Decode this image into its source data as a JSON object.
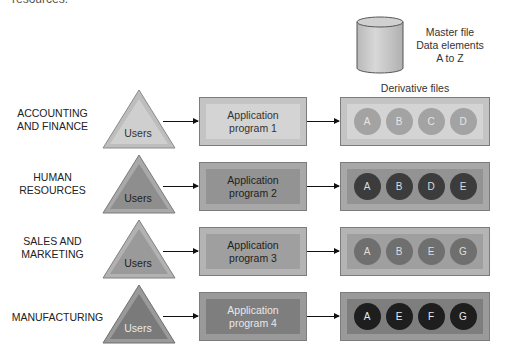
{
  "caption": "resources.",
  "master_file": {
    "lines": [
      "Master file",
      "Data elements",
      "A to Z"
    ]
  },
  "derivative_files_title": "Derivative files",
  "users_label": "Users",
  "colors": {
    "row1": {
      "tri_outer": "#bdbdbd",
      "tri_inner": "#cfcfcf",
      "box": "#c4c4c4",
      "box_inner": "#d4d4d4",
      "circle": "#a3a3a3",
      "text": "#333333",
      "circle_text": "#e6e6e6"
    },
    "row2": {
      "tri_outer": "#a9a9a9",
      "tri_inner": "#8e8e8e",
      "box": "#a8a8a8",
      "box_inner": "#939393",
      "circle": "#3c3c3c",
      "text": "#222222",
      "circle_text": "#dddddd"
    },
    "row3": {
      "tri_outer": "#b2b2b2",
      "tri_inner": "#9a9a9a",
      "box": "#b4b4b4",
      "box_inner": "#9f9f9f",
      "circle": "#6f6f6f",
      "text": "#222222",
      "circle_text": "#dddddd"
    },
    "row4": {
      "tri_outer": "#9a9a9a",
      "tri_inner": "#7a7a7a",
      "box": "#9a9a9a",
      "box_inner": "#7e7e7e",
      "circle": "#1e1e1e",
      "text": "#e8e8e8",
      "circle_text": "#e8e8e8"
    }
  },
  "rows": [
    {
      "department": [
        "ACCOUNTING",
        "AND FINANCE"
      ],
      "program": [
        "Application",
        "program 1"
      ],
      "files": [
        "A",
        "B",
        "C",
        "D"
      ]
    },
    {
      "department": [
        "HUMAN",
        "RESOURCES"
      ],
      "program": [
        "Application",
        "program 2"
      ],
      "files": [
        "A",
        "B",
        "D",
        "E"
      ]
    },
    {
      "department": [
        "SALES AND",
        "MARKETING"
      ],
      "program": [
        "Application",
        "program 3"
      ],
      "files": [
        "A",
        "B",
        "E",
        "G"
      ]
    },
    {
      "department": [
        "MANUFACTURING",
        ""
      ],
      "program": [
        "Application",
        "program 4"
      ],
      "files": [
        "A",
        "E",
        "F",
        "G"
      ]
    }
  ]
}
